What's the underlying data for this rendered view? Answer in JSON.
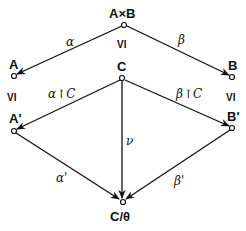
{
  "diagram": {
    "nodes": {
      "AxB": {
        "label": "A×B",
        "x": 124,
        "y": 25
      },
      "A": {
        "label": "A",
        "x": 14,
        "y": 76
      },
      "B": {
        "label": "B",
        "x": 232,
        "y": 77
      },
      "C": {
        "label": "C",
        "x": 122,
        "y": 78
      },
      "A_prime": {
        "label": "A'",
        "x": 14,
        "y": 131
      },
      "B_prime": {
        "label": "B'",
        "x": 232,
        "y": 128
      },
      "C_theta": {
        "label": "C/θ",
        "x": 123,
        "y": 202
      }
    },
    "edges": {
      "alpha": {
        "label": "α",
        "from": "A×B",
        "to": "A"
      },
      "beta": {
        "label": "β",
        "from": "A×B",
        "to": "B"
      },
      "alpha_restr": {
        "label": "α↾C",
        "from": "C",
        "to": "A'"
      },
      "beta_restr": {
        "label": "β↾C",
        "from": "C",
        "to": "B'"
      },
      "nu": {
        "label": "ν",
        "from": "C",
        "to": "C/θ"
      },
      "alpha_prime": {
        "label": "α'",
        "from": "A'",
        "to": "C/θ"
      },
      "beta_prime": {
        "label": "β'",
        "from": "B'",
        "to": "C/θ"
      }
    },
    "relations": {
      "center": "VI",
      "left": "VI",
      "right": "VI"
    }
  }
}
